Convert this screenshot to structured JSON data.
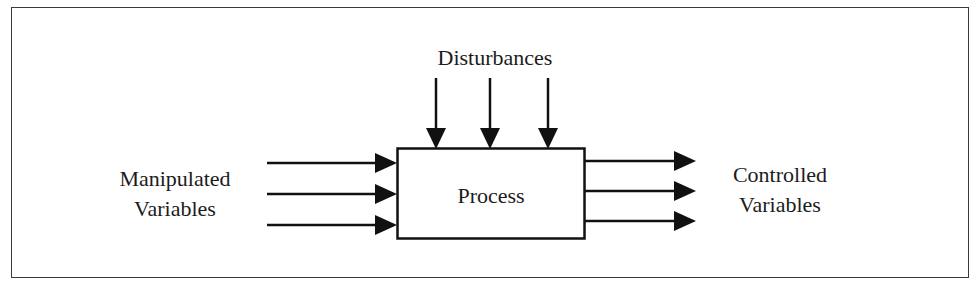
{
  "diagram": {
    "type": "block-diagram",
    "title": "",
    "nodes": {
      "process": {
        "label": "Process"
      }
    },
    "labels": {
      "disturbances": "Disturbances",
      "manipulated": {
        "line1": "Manipulated",
        "line2": "Variables"
      },
      "controlled": {
        "line1": "Controlled",
        "line2": "Variables"
      }
    },
    "edges": {
      "inputs": [
        {
          "from": "Manipulated Variables",
          "to": "Process",
          "count_index": 1
        },
        {
          "from": "Manipulated Variables",
          "to": "Process",
          "count_index": 2
        },
        {
          "from": "Manipulated Variables",
          "to": "Process",
          "count_index": 3
        }
      ],
      "disturbances": [
        {
          "from": "Disturbances",
          "to": "Process",
          "count_index": 1
        },
        {
          "from": "Disturbances",
          "to": "Process",
          "count_index": 2
        },
        {
          "from": "Disturbances",
          "to": "Process",
          "count_index": 3
        }
      ],
      "outputs": [
        {
          "from": "Process",
          "to": "Controlled Variables",
          "count_index": 1
        },
        {
          "from": "Process",
          "to": "Controlled Variables",
          "count_index": 2
        },
        {
          "from": "Process",
          "to": "Controlled Variables",
          "count_index": 3
        }
      ]
    },
    "colors": {
      "stroke": "#111111",
      "frame": "#3a3a3a",
      "background": "#ffffff"
    }
  }
}
